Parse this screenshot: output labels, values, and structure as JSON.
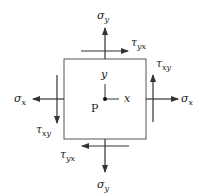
{
  "diagram": {
    "colors": {
      "stroke": "#333333",
      "box": "#555555",
      "text": "#222222",
      "tau_accent": "#5a3a2a"
    },
    "element": {
      "x": 64,
      "y": 59,
      "width": 82,
      "height": 80
    },
    "point": {
      "label": "P",
      "cx": 105,
      "cy": 99
    },
    "axes": {
      "x_label": "x",
      "y_label": "y"
    },
    "stresses": {
      "sigma_y_top": {
        "symbol": "σ",
        "subscript": "y",
        "direction": "up"
      },
      "tau_yx_top": {
        "symbol": "τ",
        "subscript": "yx",
        "direction": "right"
      },
      "sigma_y_bottom": {
        "symbol": "σ",
        "subscript": "y",
        "direction": "down"
      },
      "tau_yx_bottom": {
        "symbol": "τ",
        "subscript": "yx",
        "direction": "left"
      },
      "sigma_x_left": {
        "symbol": "σ",
        "subscript": "x",
        "direction": "left"
      },
      "tau_xy_left": {
        "symbol": "τ",
        "subscript": "xy",
        "direction": "down"
      },
      "sigma_x_right": {
        "symbol": "σ",
        "subscript": "x",
        "direction": "right"
      },
      "tau_xy_right": {
        "symbol": "τ",
        "subscript": "xy",
        "direction": "up"
      }
    }
  }
}
